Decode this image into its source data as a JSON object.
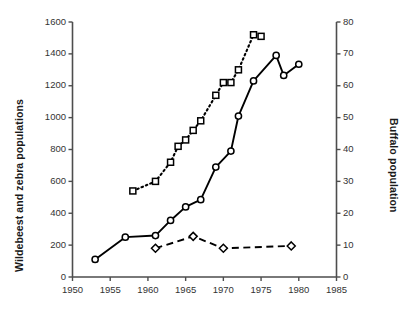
{
  "chart_data": {
    "type": "line",
    "title": "",
    "xlabel": "",
    "ylabel": "Wildebeest and zebra populations",
    "ylabel_secondary": "Buffalo population",
    "xlim": [
      1950,
      1985
    ],
    "ylim": [
      0,
      1600
    ],
    "ylim_secondary": [
      0,
      80
    ],
    "xticks": [
      1950,
      1955,
      1960,
      1965,
      1970,
      1975,
      1980,
      1985
    ],
    "xtick_labels": [
      "1950",
      "1955",
      "1960",
      "1965",
      "1970",
      "1975",
      "1980",
      "1985"
    ],
    "yticks": [
      0,
      200,
      400,
      600,
      800,
      1000,
      1200,
      1400,
      1600
    ],
    "ytick_labels": [
      "0",
      "200",
      "400",
      "600",
      "800",
      "1000",
      "1200",
      "1400",
      "1600"
    ],
    "yticks_secondary": [
      0,
      10,
      20,
      30,
      40,
      50,
      60,
      70,
      80
    ],
    "ytick_labels_secondary": [
      "0",
      "10",
      "20",
      "30",
      "40",
      "50",
      "60",
      "70",
      "80"
    ],
    "grid": false,
    "legend": "none",
    "series": [
      {
        "name": "Wildebeest",
        "marker": "circle",
        "linestyle": "solid",
        "axis": "left",
        "color": "#000000",
        "points": [
          {
            "x": 1953,
            "y": 110
          },
          {
            "x": 1957,
            "y": 250
          },
          {
            "x": 1961,
            "y": 260
          },
          {
            "x": 1963,
            "y": 355
          },
          {
            "x": 1965,
            "y": 440
          },
          {
            "x": 1967,
            "y": 485
          },
          {
            "x": 1969,
            "y": 690
          },
          {
            "x": 1971,
            "y": 790
          },
          {
            "x": 1972,
            "y": 1010
          },
          {
            "x": 1974,
            "y": 1230
          },
          {
            "x": 1977,
            "y": 1390
          },
          {
            "x": 1978,
            "y": 1265
          },
          {
            "x": 1980,
            "y": 1335
          }
        ]
      },
      {
        "name": "Zebra",
        "marker": "diamond",
        "linestyle": "dashed",
        "axis": "left",
        "color": "#000000",
        "points": [
          {
            "x": 1961,
            "y": 180
          },
          {
            "x": 1966,
            "y": 255
          },
          {
            "x": 1970,
            "y": 180
          },
          {
            "x": 1979,
            "y": 195
          }
        ]
      },
      {
        "name": "Buffalo",
        "marker": "square",
        "linestyle": "dotted",
        "axis": "right",
        "color": "#000000",
        "points": [
          {
            "x": 1958,
            "y": 27
          },
          {
            "x": 1961,
            "y": 30
          },
          {
            "x": 1963,
            "y": 36
          },
          {
            "x": 1964,
            "y": 41
          },
          {
            "x": 1965,
            "y": 43
          },
          {
            "x": 1966,
            "y": 46
          },
          {
            "x": 1967,
            "y": 49
          },
          {
            "x": 1969,
            "y": 57
          },
          {
            "x": 1970,
            "y": 61
          },
          {
            "x": 1971,
            "y": 61
          },
          {
            "x": 1972,
            "y": 65
          },
          {
            "x": 1974,
            "y": 76
          },
          {
            "x": 1975,
            "y": 75.5
          }
        ]
      }
    ]
  },
  "colors": {
    "axis": "#4d4d4d",
    "ink": "#000000",
    "text": "#1a1a1a",
    "background": "#ffffff"
  }
}
